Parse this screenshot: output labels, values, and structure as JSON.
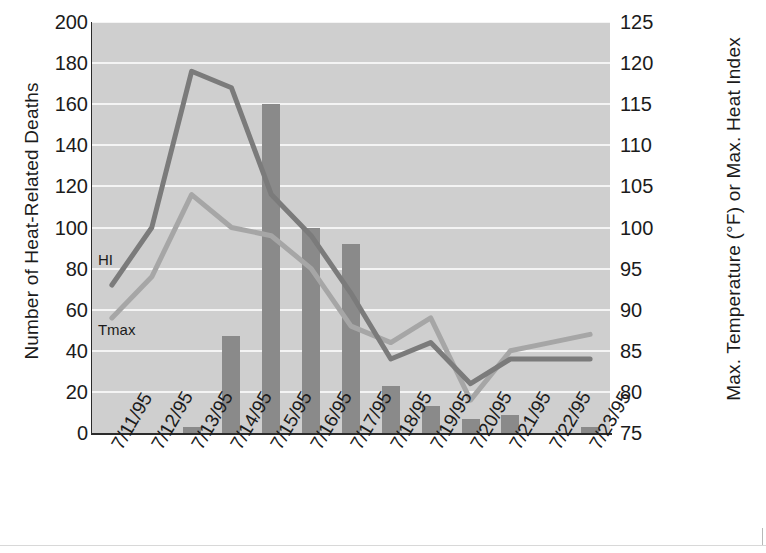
{
  "chart_data": {
    "type": "bar",
    "title": "",
    "subtitle": "",
    "xlabel": "",
    "ylabel": "Number of Heat-Related Deaths",
    "y2label": "Max. Temperature (°F) or Max. Heat Index",
    "grid": true,
    "legend_position": "inline-annotation",
    "categories": [
      "7/11/95",
      "7/12/95",
      "7/13/95",
      "7/14/95",
      "7/15/95",
      "7/16/95",
      "7/17/95",
      "7/18/95",
      "7/19/95",
      "7/20/95",
      "7/21/95",
      "7/22/95",
      "7/23/95"
    ],
    "ylim": [
      0,
      200
    ],
    "yticks": [
      0,
      20,
      40,
      60,
      80,
      100,
      120,
      140,
      160,
      180,
      200
    ],
    "y2lim": [
      75,
      125
    ],
    "y2ticks": [
      75,
      80,
      85,
      90,
      95,
      100,
      105,
      110,
      115,
      120,
      125
    ],
    "bar_series": {
      "name": "Number of Heat-Related Deaths",
      "axis": "left",
      "color": "#8a8a8a",
      "values": [
        0,
        0,
        3,
        47,
        160,
        100,
        92,
        23,
        13,
        7,
        9,
        0,
        3
      ]
    },
    "series": [
      {
        "name": "HI",
        "label": "HI",
        "axis": "right",
        "color": "#7b7b7b",
        "units": "°F",
        "values": [
          93,
          100,
          119,
          117,
          104,
          99,
          92,
          84,
          86,
          81,
          84,
          84,
          84
        ]
      },
      {
        "name": "Tmax",
        "label": "Tmax",
        "axis": "right",
        "color": "#a6a6a6",
        "units": "°F",
        "values": [
          89,
          94,
          104,
          100,
          99,
          95,
          88,
          86,
          89,
          79,
          85,
          86,
          87
        ]
      }
    ],
    "annotations": [
      {
        "text": "HI",
        "x_index": 0,
        "value_left": 84
      },
      {
        "text": "Tmax",
        "x_index": 0,
        "value_left": 50
      }
    ],
    "colors": {
      "plot_background": "#cfcfcf",
      "gridline": "#f4f4f4",
      "axis": "#2b2b2b",
      "bar": "#8a8a8a",
      "hi_line": "#7b7b7b",
      "tmax_line": "#a6a6a6",
      "text": "#1b1b1b"
    }
  }
}
